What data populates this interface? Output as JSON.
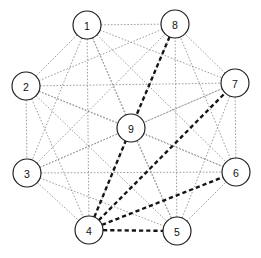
{
  "figure": {
    "title": "",
    "type": "node-link-graph",
    "width": 261,
    "height": 258,
    "background_color": "#ffffff"
  },
  "style": {
    "node_fill": "#ffffff",
    "node_stroke": "#1a1a1a",
    "node_radius": 14,
    "label_color": "#111111",
    "edge_normal_color": "#8c8c8c",
    "edge_normal_width": 0.85,
    "edge_normal_dash": "1.6 1.7",
    "edge_highlight_color": "#141414",
    "edge_highlight_width": 2.35,
    "edge_highlight_dash": "4.2 3.0"
  },
  "nodes": [
    {
      "id": "1",
      "label": "1",
      "x": 87,
      "y": 25
    },
    {
      "id": "2",
      "label": "2",
      "x": 26,
      "y": 86
    },
    {
      "id": "3",
      "label": "3",
      "x": 27,
      "y": 173
    },
    {
      "id": "4",
      "label": "4",
      "x": 89,
      "y": 230
    },
    {
      "id": "5",
      "label": "5",
      "x": 177,
      "y": 231
    },
    {
      "id": "6",
      "label": "6",
      "x": 236,
      "y": 172
    },
    {
      "id": "7",
      "label": "7",
      "x": 235,
      "y": 83
    },
    {
      "id": "8",
      "label": "8",
      "x": 175,
      "y": 24
    },
    {
      "id": "9",
      "label": "9",
      "x": 131,
      "y": 128
    }
  ],
  "edges": [
    {
      "from": "1",
      "to": "2",
      "highlight": false
    },
    {
      "from": "1",
      "to": "3",
      "highlight": false
    },
    {
      "from": "1",
      "to": "4",
      "highlight": false
    },
    {
      "from": "1",
      "to": "5",
      "highlight": false
    },
    {
      "from": "1",
      "to": "6",
      "highlight": false
    },
    {
      "from": "1",
      "to": "7",
      "highlight": false
    },
    {
      "from": "1",
      "to": "8",
      "highlight": false
    },
    {
      "from": "1",
      "to": "9",
      "highlight": false
    },
    {
      "from": "2",
      "to": "3",
      "highlight": false
    },
    {
      "from": "2",
      "to": "4",
      "highlight": false
    },
    {
      "from": "2",
      "to": "5",
      "highlight": false
    },
    {
      "from": "2",
      "to": "6",
      "highlight": false
    },
    {
      "from": "2",
      "to": "7",
      "highlight": false
    },
    {
      "from": "2",
      "to": "8",
      "highlight": false
    },
    {
      "from": "2",
      "to": "9",
      "highlight": false
    },
    {
      "from": "3",
      "to": "4",
      "highlight": false
    },
    {
      "from": "3",
      "to": "5",
      "highlight": false
    },
    {
      "from": "3",
      "to": "6",
      "highlight": false
    },
    {
      "from": "3",
      "to": "7",
      "highlight": false
    },
    {
      "from": "3",
      "to": "8",
      "highlight": false
    },
    {
      "from": "3",
      "to": "9",
      "highlight": false
    },
    {
      "from": "4",
      "to": "5",
      "highlight": true
    },
    {
      "from": "4",
      "to": "6",
      "highlight": true
    },
    {
      "from": "4",
      "to": "7",
      "highlight": true
    },
    {
      "from": "4",
      "to": "8",
      "highlight": false
    },
    {
      "from": "4",
      "to": "9",
      "highlight": true
    },
    {
      "from": "5",
      "to": "6",
      "highlight": false
    },
    {
      "from": "5",
      "to": "7",
      "highlight": false
    },
    {
      "from": "5",
      "to": "8",
      "highlight": false
    },
    {
      "from": "5",
      "to": "9",
      "highlight": false
    },
    {
      "from": "6",
      "to": "7",
      "highlight": false
    },
    {
      "from": "6",
      "to": "8",
      "highlight": false
    },
    {
      "from": "6",
      "to": "9",
      "highlight": false
    },
    {
      "from": "7",
      "to": "8",
      "highlight": false
    },
    {
      "from": "7",
      "to": "9",
      "highlight": false
    },
    {
      "from": "8",
      "to": "9",
      "highlight": true
    }
  ]
}
